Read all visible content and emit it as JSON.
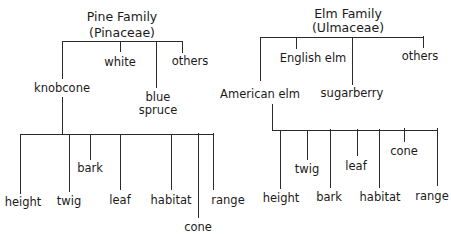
{
  "pine": {
    "title": "Pine Family",
    "subtitle": "(Pinaceae)",
    "species": [
      {
        "label": "knobcone"
      },
      {
        "label": "white"
      },
      {
        "label_line1": "blue",
        "label_line2": "spruce"
      },
      {
        "label": "others"
      }
    ],
    "attributes": [
      "height",
      "twig",
      "bark",
      "leaf",
      "habitat",
      "cone",
      "range"
    ]
  },
  "elm": {
    "title": "Elm Family",
    "subtitle": "(Ulmaceae)",
    "species": [
      {
        "label": "American elm"
      },
      {
        "label": "English elm"
      },
      {
        "label": "sugarberry"
      },
      {
        "label": "others"
      }
    ],
    "attributes": [
      "height",
      "twig",
      "bark",
      "leaf",
      "habitat",
      "cone",
      "range"
    ]
  }
}
